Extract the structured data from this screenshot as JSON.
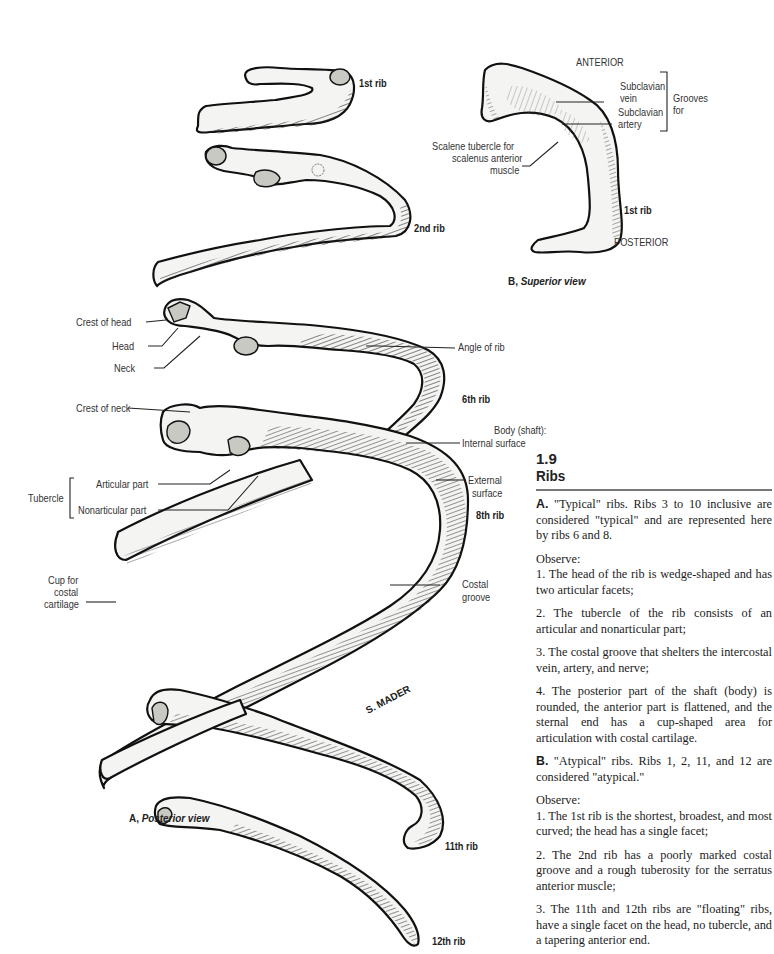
{
  "figure": {
    "number": "1.9",
    "title": "Ribs"
  },
  "panel_a": {
    "caption_letter": "A,",
    "caption_view": "Posterior view",
    "rib_labels": {
      "rib1": "1st rib",
      "rib2": "2nd rib",
      "rib6": "6th rib",
      "rib8": "8th rib",
      "rib11": "11th rib",
      "rib12": "12th rib"
    },
    "labels": {
      "crest_of_head": "Crest of head",
      "head": "Head",
      "neck": "Neck",
      "angle_of_rib": "Angle of rib",
      "crest_of_neck": "Crest of neck",
      "body_shaft": "Body (shaft):",
      "internal_surface": "Internal surface",
      "tubercle": "Tubercle",
      "articular_part": "Articular part",
      "nonarticular_part": "Nonarticular part",
      "external_surface_1": "External",
      "external_surface_2": "surface",
      "cup_1": "Cup for",
      "cup_2": "costal",
      "cup_3": "cartilage",
      "costal_groove_1": "Costal",
      "costal_groove_2": "groove"
    },
    "signature": "S. MADER"
  },
  "panel_b": {
    "caption_letter": "B,",
    "caption_view": "Superior view",
    "labels": {
      "anterior": "ANTERIOR",
      "posterior": "POSTERIOR",
      "subclavian_vein_1": "Subclavian",
      "subclavian_vein_2": "vein",
      "subclavian_artery_1": "Subclavian",
      "subclavian_artery_2": "artery",
      "grooves_for_1": "Grooves",
      "grooves_for_2": "for",
      "scalene_1": "Scalene tubercle for",
      "scalene_2": "scalenus anterior",
      "scalene_3": "muscle",
      "rib1": "1st rib"
    }
  },
  "text": {
    "a_letter": "A.",
    "a_intro": " \"Typical\" ribs. Ribs 3 to 10 inclusive are considered \"typical\" and are represented here by ribs 6 and 8.",
    "a_observe": "Observe:",
    "a_points": [
      "1. The head of the rib is wedge-shaped and has two articular facets;",
      "2. The tubercle of the rib consists of an articular and nonarticular part;",
      "3. The costal groove that shelters the intercostal vein, artery, and nerve;",
      "4. The posterior part of the shaft (body) is rounded, the anterior part is flattened, and the sternal end has a cup-shaped area for articulation with costal cartilage."
    ],
    "b_letter": "B.",
    "b_intro": " \"Atypical\" ribs. Ribs 1, 2, 11, and 12 are considered \"atypical.\"",
    "b_observe": "Observe:",
    "b_points": [
      "1. The 1st rib is the shortest, broadest, and most curved; the head has a single facet;",
      "2. The 2nd rib has a poorly marked costal groove and a rough tuberosity for the serratus anterior muscle;",
      "3. The 11th and 12th ribs are \"floating\" ribs, have a single facet on the head, no tubercle, and a tapering anterior end."
    ]
  }
}
